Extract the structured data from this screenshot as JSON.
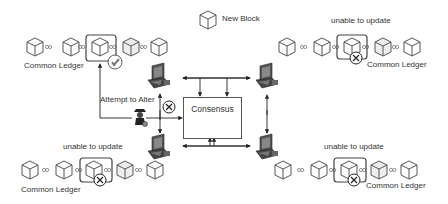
{
  "legend": {
    "new_block_label": "New Block",
    "icon": "cube-icon"
  },
  "consensus": {
    "label": "Consensus",
    "icon": "handshake-icon"
  },
  "attacker": {
    "label": "Attempt to Alter",
    "icon": "spy-icon"
  },
  "ledgers": [
    {
      "id": "top-left",
      "label": "Common Ledger",
      "status": "",
      "mark": "check-icon",
      "blocks": 5
    },
    {
      "id": "top-right",
      "label": "Common Ledger",
      "status": "unable to update",
      "mark": "cross-icon",
      "blocks": 5
    },
    {
      "id": "bottom-left",
      "label": "Common Ledger",
      "status": "unable to update",
      "mark": "cross-icon",
      "blocks": 5
    },
    {
      "id": "bottom-right",
      "label": "Common Ledger",
      "status": "unable to update",
      "mark": "cross-icon",
      "blocks": 5
    }
  ],
  "nodes": [
    {
      "id": "node-top-left",
      "icon": "computer-icon"
    },
    {
      "id": "node-top-right",
      "icon": "computer-icon"
    },
    {
      "id": "node-bottom-left",
      "icon": "computer-icon"
    },
    {
      "id": "node-bottom-right",
      "icon": "computer-icon"
    }
  ],
  "colors": {
    "line": "#333333",
    "block_stroke": "#555555",
    "block_fill": "#ffffff",
    "text": "#333333"
  }
}
